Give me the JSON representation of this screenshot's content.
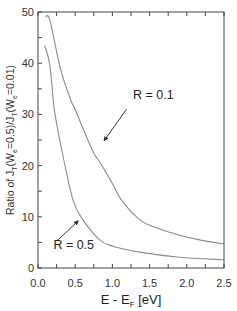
{
  "chart_data": {
    "type": "line",
    "title": "",
    "xlabel": "E - E_F [eV]",
    "ylabel": "Ratio of J_T(W_e=0.5)/J_T(W_e=0.01)",
    "xlim": [
      0,
      2.5
    ],
    "ylim": [
      0,
      50
    ],
    "x_ticks": [
      0.0,
      0.5,
      1.0,
      1.5,
      2.0,
      2.5
    ],
    "x_tick_labels": [
      "0.0",
      "0.5",
      "1.0",
      "1.5",
      "2.0",
      "2.5"
    ],
    "x_minor_step": 0.25,
    "y_ticks": [
      0,
      10,
      20,
      30,
      40,
      50
    ],
    "y_tick_labels": [
      "0",
      "10",
      "20",
      "30",
      "40",
      "50"
    ],
    "y_minor_step": 5,
    "grid": false,
    "legend": "none (inline annotations with arrows)",
    "series": [
      {
        "name": "R = 0.1",
        "x": [
          0.1,
          0.16,
          0.3,
          0.44,
          0.5,
          0.73,
          0.83,
          1.0,
          1.12,
          1.37,
          1.6,
          1.9,
          2.2,
          2.5
        ],
        "y": [
          49.0,
          48.4,
          39.0,
          32.8,
          30.9,
          23.0,
          20.7,
          16.5,
          13.3,
          9.4,
          7.8,
          6.4,
          5.4,
          4.7
        ]
      },
      {
        "name": "R = 0.5",
        "x": [
          0.09,
          0.16,
          0.22,
          0.32,
          0.47,
          0.6,
          0.83,
          1.0,
          1.37,
          1.9,
          2.5
        ],
        "y": [
          43.5,
          39.6,
          30.9,
          23.0,
          13.3,
          9.5,
          5.5,
          4.3,
          3.1,
          2.1,
          1.6
        ]
      }
    ],
    "annotations": [
      {
        "text": "R = 0.1",
        "x": 1.55,
        "y": 33.0,
        "arrow_from": [
          1.19,
          31.0
        ],
        "arrow_to": [
          0.89,
          24.9
        ],
        "points_to_series": "R = 0.1"
      },
      {
        "text": "R = 0.5",
        "x": 0.48,
        "y": 3.8,
        "arrow_from": [
          0.27,
          5.5
        ],
        "arrow_to": [
          0.54,
          9.2
        ],
        "points_to_series": "R = 0.5"
      }
    ]
  },
  "labels": {
    "ylabel_prefix": "Ratio of J",
    "ylabel_sub1": "T",
    "ylabel_mid1": "(W",
    "ylabel_sub2": "e",
    "ylabel_mid2": "=0.5)/J",
    "ylabel_sub3": "T",
    "ylabel_mid3": "(W",
    "ylabel_sub4": "e",
    "ylabel_end": "=0.01)",
    "xlabel_main": "E - E",
    "xlabel_sub": "F",
    "xlabel_unit": " [eV]"
  },
  "style": {
    "axis_color": "#444444",
    "curve_color": "#8a8a8a",
    "arrow_color": "#333333"
  }
}
